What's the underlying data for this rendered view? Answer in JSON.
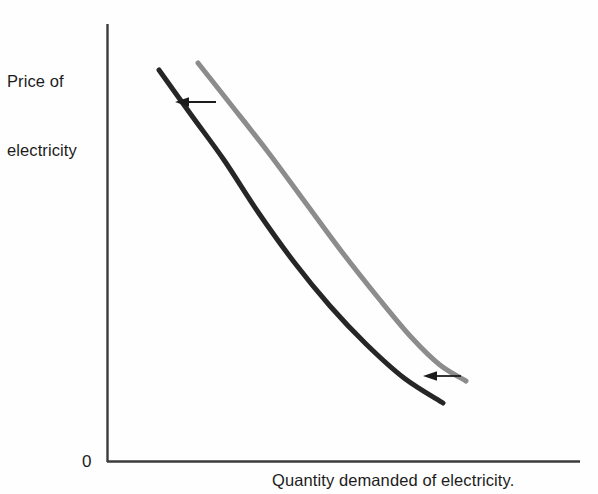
{
  "figure": {
    "background_color": "#fefefe",
    "width": 598,
    "height": 494
  },
  "labels": {
    "ylabel_line1": "Price of",
    "ylabel_line2": "electricity",
    "xlabel": "Quantity demanded of electricity.",
    "origin": "0"
  },
  "colors": {
    "axis": "#3b3b3b",
    "original_curve": "#8c8c8c",
    "shifted_curve": "#262626",
    "arrow": "#1c1c1c",
    "text": "#1c1c1c"
  },
  "chart_data": {
    "type": "line",
    "title": "",
    "xlabel": "Quantity demanded of electricity.",
    "ylabel": "Price of electricity",
    "grid": false,
    "legend": "none",
    "axis_origin_label": "0",
    "xlim": [
      107,
      580
    ],
    "ylim": [
      462,
      24
    ],
    "axes": {
      "y_axis": {
        "x": 107,
        "y_top": 24,
        "y_bottom": 462
      },
      "x_axis": {
        "y": 462,
        "x_left": 107,
        "x_right": 580
      }
    },
    "series": [
      {
        "name": "Original demand curve",
        "color": "#8c8c8c",
        "stroke_width": 5,
        "shape": "convex-to-origin",
        "points": [
          [
            198,
            63
          ],
          [
            232,
            106
          ],
          [
            268,
            152
          ],
          [
            305,
            202
          ],
          [
            342,
            252
          ],
          [
            380,
            300
          ],
          [
            412,
            338
          ],
          [
            440,
            365
          ],
          [
            466,
            381
          ]
        ]
      },
      {
        "name": "Shifted (decreased) demand curve",
        "color": "#262626",
        "stroke_width": 5,
        "shape": "convex-to-origin",
        "points": [
          [
            159,
            70
          ],
          [
            192,
            116
          ],
          [
            224,
            160
          ],
          [
            258,
            212
          ],
          [
            294,
            262
          ],
          [
            330,
            306
          ],
          [
            366,
            344
          ],
          [
            404,
            378
          ],
          [
            443,
            403
          ]
        ]
      }
    ],
    "annotations": [
      {
        "type": "arrow",
        "name": "upper-shift-arrow",
        "direction": "left",
        "x_tail": 216,
        "y_tail": 102,
        "x_head": 175,
        "y_head": 102,
        "meaning": "demand curve shifts left"
      },
      {
        "type": "arrow",
        "name": "lower-shift-arrow",
        "direction": "left",
        "x_tail": 461,
        "y_tail": 376,
        "x_head": 423,
        "y_head": 376,
        "meaning": "demand curve shifts left"
      }
    ]
  }
}
